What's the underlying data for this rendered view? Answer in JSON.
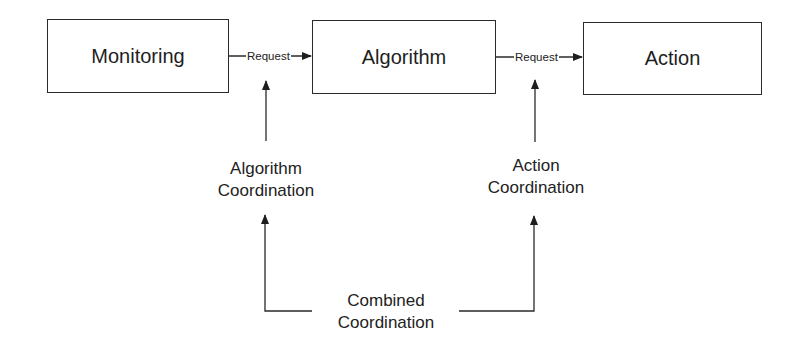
{
  "diagram": {
    "boxes": [
      {
        "id": "monitoring",
        "label": "Monitoring"
      },
      {
        "id": "algorithm",
        "label": "Algorithm"
      },
      {
        "id": "action",
        "label": "Action"
      }
    ],
    "edges": [
      {
        "from": "monitoring",
        "to": "algorithm",
        "label": "Request"
      },
      {
        "from": "algorithm",
        "to": "action",
        "label": "Request"
      }
    ],
    "coordination": {
      "algorithm": {
        "line1": "Algorithm",
        "line2": "Coordination"
      },
      "action": {
        "line1": "Action",
        "line2": "Coordination"
      },
      "combined": {
        "line1": "Combined",
        "line2": "Coordination"
      }
    },
    "colors": {
      "stroke": "#2a2a2a",
      "background": "#ffffff"
    }
  }
}
